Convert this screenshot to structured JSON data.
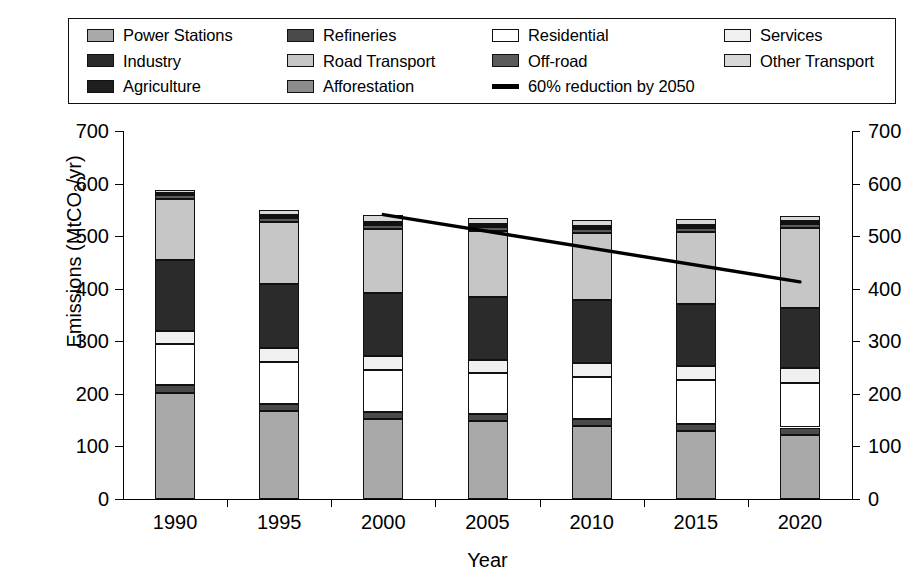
{
  "chart_data": {
    "type": "bar",
    "title": "",
    "subtitle": "",
    "xlabel": "Year",
    "ylabel": "Emissions (MtCO2/yr)",
    "ylabel_parts": {
      "pre": "Emissions (MtCO",
      "sub": "2",
      "post": "/yr)"
    },
    "categories": [
      "1990",
      "1995",
      "2000",
      "2005",
      "2010",
      "2015",
      "2020"
    ],
    "ylim": [
      0,
      700
    ],
    "yticks": [
      0,
      100,
      200,
      300,
      400,
      500,
      600,
      700
    ],
    "ytick_labels": [
      "0",
      "100",
      "200",
      "300",
      "400",
      "500",
      "600",
      "700"
    ],
    "right_axis": true,
    "right_ytick_labels": [
      "0",
      "100",
      "200",
      "300",
      "400",
      "500",
      "600",
      "700"
    ],
    "grid": false,
    "legend_position": "top",
    "stacked": true,
    "series": [
      {
        "name": "Power Stations",
        "color": "#a9a9a9",
        "values": [
          202,
          167,
          153,
          148,
          139,
          130,
          122
        ]
      },
      {
        "name": "Refineries",
        "color": "#4a4a4a",
        "values": [
          15,
          14,
          13,
          13,
          13,
          13,
          14
        ]
      },
      {
        "name": "Residential",
        "color": "#ffffff",
        "values": [
          78,
          80,
          80,
          78,
          80,
          83,
          85
        ]
      },
      {
        "name": "Services",
        "color": "#f0f0f0",
        "values": [
          25,
          26,
          26,
          25,
          26,
          27,
          29
        ]
      },
      {
        "name": "Industry",
        "color": "#2b2b2b",
        "values": [
          135,
          122,
          119,
          120,
          120,
          117,
          113
        ]
      },
      {
        "name": "Road Transport",
        "color": "#c6c6c6",
        "values": [
          115,
          118,
          122,
          125,
          128,
          138,
          152
        ]
      },
      {
        "name": "Off-road",
        "color": "#5a5a5a",
        "values": [
          8,
          8,
          8,
          8,
          8,
          8,
          8
        ]
      },
      {
        "name": "Agriculture",
        "color": "#1f1f1f",
        "values": [
          4,
          4,
          4,
          4,
          4,
          4,
          4
        ]
      },
      {
        "name": "Afforestation",
        "color": "#8c8c8c",
        "values": [
          -1,
          -1,
          -2,
          -2,
          -2,
          -2,
          -2
        ]
      },
      {
        "name": "Other Transport",
        "color": "#d8d8d8",
        "values": [
          4,
          10,
          14,
          12,
          10,
          10,
          10
        ]
      }
    ],
    "totals": [
      585,
      548,
      541,
      533,
      519,
      528,
      528
    ],
    "trend_line": {
      "name": "60% reduction by 2050",
      "color": "#000000",
      "points": [
        {
          "x": "2000",
          "y": 541
        },
        {
          "x": "2020",
          "y": 413
        }
      ]
    }
  },
  "legend": {
    "entries": [
      {
        "label": "Power Stations",
        "swatch": "color",
        "color": "#a9a9a9",
        "icon": "legend-swatch-icon"
      },
      {
        "label": "Refineries",
        "swatch": "color",
        "color": "#4a4a4a",
        "icon": "legend-swatch-icon"
      },
      {
        "label": "Residential",
        "swatch": "color",
        "color": "#ffffff",
        "icon": "legend-swatch-icon"
      },
      {
        "label": "Services",
        "swatch": "color",
        "color": "#f0f0f0",
        "icon": "legend-swatch-icon"
      },
      {
        "label": "Industry",
        "swatch": "color",
        "color": "#2b2b2b",
        "icon": "legend-swatch-icon"
      },
      {
        "label": "Road Transport",
        "swatch": "color",
        "color": "#c6c6c6",
        "icon": "legend-swatch-icon"
      },
      {
        "label": "Off-road",
        "swatch": "color",
        "color": "#5a5a5a",
        "icon": "legend-swatch-icon"
      },
      {
        "label": "Other Transport",
        "swatch": "color",
        "color": "#d8d8d8",
        "icon": "legend-swatch-icon"
      },
      {
        "label": "Agriculture",
        "swatch": "color",
        "color": "#1f1f1f",
        "icon": "legend-swatch-icon"
      },
      {
        "label": "Afforestation",
        "swatch": "color",
        "color": "#8c8c8c",
        "icon": "legend-swatch-icon"
      },
      {
        "label": "60% reduction by 2050",
        "swatch": "line",
        "color": "#000000",
        "icon": "legend-line-icon"
      }
    ],
    "order": [
      0,
      1,
      2,
      3,
      4,
      5,
      6,
      7,
      8,
      9,
      10
    ],
    "layout_columns": [
      [
        "Power Stations",
        "Industry",
        "Agriculture"
      ],
      [
        "Refineries",
        "Road Transport",
        "Afforestation"
      ],
      [
        "Residential",
        "Off-road",
        "60% reduction by 2050"
      ],
      [
        "Services",
        "Other Transport",
        ""
      ]
    ]
  }
}
